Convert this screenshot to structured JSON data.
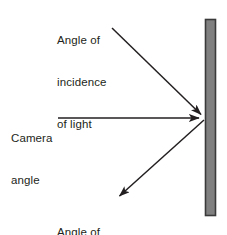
{
  "diagram": {
    "background_color": "#ffffff",
    "stroke_color": "#231f20",
    "text_color": "#231f20",
    "surface": {
      "name": "reflective surface",
      "fill_color": "#808080",
      "border_color": "#3a3a3a",
      "x": 205,
      "y": 19,
      "width": 11,
      "height": 197
    },
    "labels": {
      "incidence": {
        "line1": "Angle of",
        "line2": "incidence",
        "line3": "of light"
      },
      "camera": {
        "line1": "Camera",
        "line2": "angle"
      },
      "reflection": {
        "line1": "Angle of",
        "line2": "reflection"
      }
    },
    "rays": [
      {
        "name": "incident-ray",
        "label": "Angle of incidence of light",
        "from_x": 112,
        "from_y": 28,
        "to_x": 204,
        "to_y": 117,
        "arrowhead_at": "end"
      },
      {
        "name": "camera-ray",
        "label": "Camera angle",
        "from_x": 58,
        "from_y": 118,
        "to_x": 203,
        "to_y": 118,
        "arrowhead_at": "end"
      },
      {
        "name": "reflected-ray",
        "label": "Angle of reflection",
        "from_x": 204,
        "from_y": 119,
        "to_x": 116,
        "to_y": 199,
        "arrowhead_at": "end"
      }
    ]
  }
}
